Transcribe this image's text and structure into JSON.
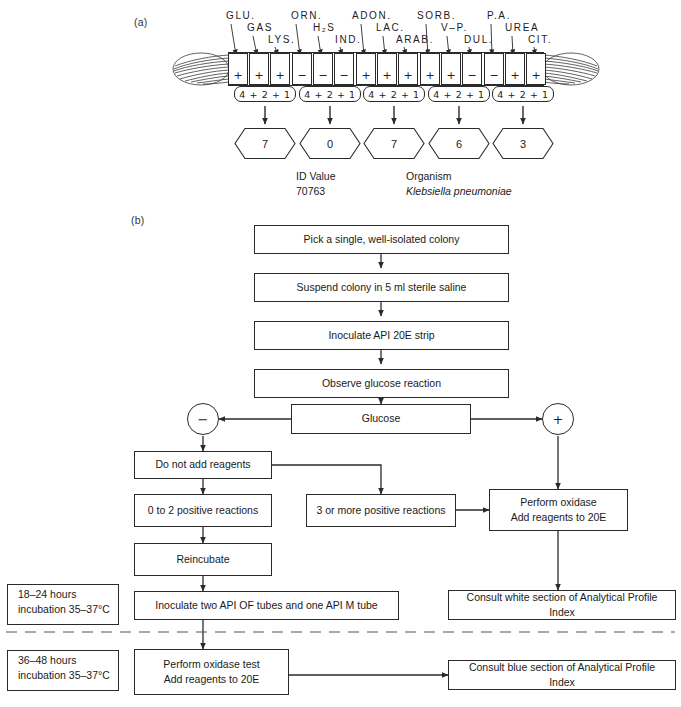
{
  "figure": {
    "panel_a_label": "(a)",
    "panel_b_label": "(b)"
  },
  "strip": {
    "tests": [
      {
        "code": "GLU.",
        "result": "+"
      },
      {
        "code": "GAS",
        "result": "+"
      },
      {
        "code": "LYS.",
        "result": "+"
      },
      {
        "code": "ORN.",
        "result": "−"
      },
      {
        "code": "H₂S",
        "result": "−"
      },
      {
        "code": "IND.",
        "result": "−"
      },
      {
        "code": "ADON.",
        "result": "+"
      },
      {
        "code": "LAC.",
        "result": "+"
      },
      {
        "code": "ARAB.",
        "result": "+"
      },
      {
        "code": "SORB.",
        "result": "+"
      },
      {
        "code": "V–P.",
        "result": "+"
      },
      {
        "code": "DUL.",
        "result": "−"
      },
      {
        "code": "P.A.",
        "result": "−"
      },
      {
        "code": "UREA",
        "result": "+"
      },
      {
        "code": "CIT.",
        "result": "+"
      }
    ],
    "group_weights_label": "4 + 2 + 1",
    "groups": [
      {
        "weights": "4 + 2 + 1",
        "digit": "7"
      },
      {
        "weights": "4 + 2 + 1",
        "digit": "0"
      },
      {
        "weights": "4 + 2 + 1",
        "digit": "7"
      },
      {
        "weights": "4 + 2 + 1",
        "digit": "6"
      },
      {
        "weights": "4 + 2 + 1",
        "digit": "3"
      }
    ],
    "id_value_label": "ID Value",
    "id_value": "70763",
    "organism_label": "Organism",
    "organism_name": "Klebsiella pneumoniae"
  },
  "flowchart": {
    "steps": {
      "pick_colony": "Pick a single, well-isolated colony",
      "suspend": "Suspend colony in 5 ml sterile saline",
      "inoculate_strip": "Inoculate API 20E strip",
      "observe": "Observe glucose reaction",
      "glucose": "Glucose",
      "negative": "−",
      "positive": "+",
      "no_reagents": "Do not add reagents",
      "zero_to_two": "0 to 2 positive reactions",
      "three_or_more": "3 or more positive reactions",
      "perform_oxidase_line1": "Perform oxidase",
      "perform_oxidase_line2": "Add reagents to 20E",
      "reincubate": "Reincubate",
      "inoculate_tubes": "Inoculate two API OF tubes and one API M tube",
      "consult_white": "Consult white section of Analytical Profile Index",
      "oxidase_test_line1": "Perform oxidase test",
      "oxidase_test_line2": "Add reagents to 20E",
      "consult_blue": "Consult blue section of Analytical Profile Index"
    },
    "incubation": {
      "first_line1": "18–24 hours",
      "first_line2": "incubation 35–37°C",
      "second_line1": "36–48 hours",
      "second_line2": "incubation 35–37°C"
    }
  },
  "colors": {
    "ink": "#1a1a1a",
    "line": "#2a2a2a",
    "background": "#ffffff"
  }
}
